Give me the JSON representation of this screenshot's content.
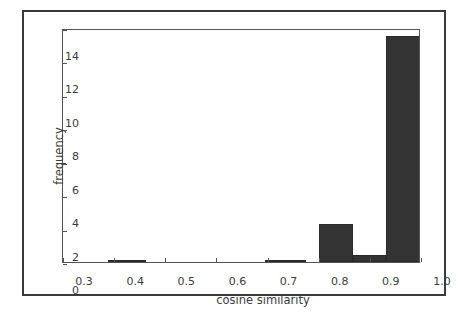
{
  "chart_data": {
    "type": "bar",
    "title": "",
    "subtitle": "",
    "xlabel": "cosine similarity",
    "ylabel": "frequency",
    "xlim": [
      0.3,
      1.0
    ],
    "ylim": [
      0,
      14
    ],
    "grid": false,
    "legend": null,
    "bar_color": "#333333",
    "xticks": [
      "0.3",
      "0.4",
      "0.5",
      "0.6",
      "0.7",
      "0.8",
      "0.9",
      "1.0"
    ],
    "xtick_values": [
      0.3,
      0.4,
      0.5,
      0.6,
      0.7,
      0.8,
      0.9,
      1.0
    ],
    "yticks": [
      "0",
      "2",
      "4",
      "6",
      "8",
      "10",
      "12",
      "14"
    ],
    "ytick_values": [
      0,
      2,
      4,
      6,
      8,
      10,
      12,
      14
    ],
    "bins": [
      {
        "x0": 0.3,
        "x1": 0.3875,
        "value": 0.0
      },
      {
        "x0": 0.3875,
        "x1": 0.4625,
        "value": 0.08
      },
      {
        "x0": 0.4625,
        "x1": 0.55,
        "value": 0.0
      },
      {
        "x0": 0.55,
        "x1": 0.6375,
        "value": 0.0
      },
      {
        "x0": 0.6375,
        "x1": 0.695,
        "value": 0.0
      },
      {
        "x0": 0.695,
        "x1": 0.775,
        "value": 0.05
      },
      {
        "x0": 0.8,
        "x1": 0.868,
        "value": 2.25
      },
      {
        "x0": 0.868,
        "x1": 0.932,
        "value": 0.4
      },
      {
        "x0": 0.932,
        "x1": 1.0,
        "value": 13.5
      }
    ]
  },
  "figure": {
    "frame_color": "#3a3a3a",
    "background": "#ffffff"
  }
}
